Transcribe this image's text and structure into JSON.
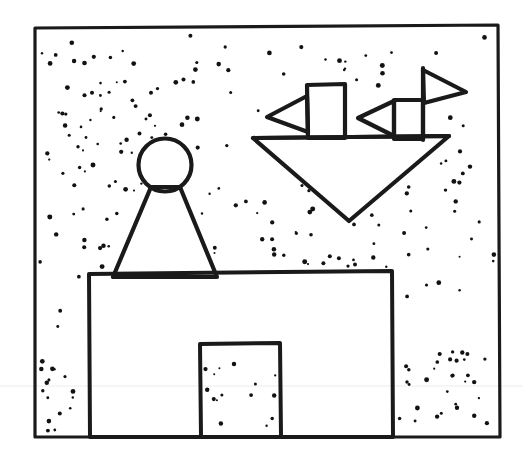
{
  "artwork": {
    "title": "Pawn Figure On Platform With Floating Flagged Boat",
    "medium": "hand-drawn ink line illustration",
    "background_color": "#ffffff",
    "ink_color": "#1a1a1a",
    "canvas": {
      "width": 523,
      "height": 466
    }
  },
  "frame": {
    "name": "picture-border",
    "stroke_width": 3.2,
    "points": "35,28 498,25 500,437 35,437"
  },
  "sky": {
    "name": "stippled-sky",
    "dot_color": "#121212",
    "dot_count": 232,
    "description": "scattered stipple dots filling background"
  },
  "figure": {
    "name": "pawn-figure",
    "head": {
      "cx": 165,
      "cy": 165,
      "r": 26.5,
      "stroke_width": 4.2
    },
    "body": {
      "points": "151,187 113,277 217,277 180,187",
      "stroke_width": 4.2
    }
  },
  "building": {
    "name": "platform-building",
    "stroke_width": 4.0,
    "outline": "89,274 392,271 393,437 90,437",
    "door": {
      "name": "doorway",
      "stroke_width": 4.0,
      "outline": "200,344 280,343 281,437 201,437"
    }
  },
  "boat": {
    "name": "floating-boat",
    "stroke_width": 4.2,
    "hull": {
      "points": "253,138 449,136 349,221"
    },
    "deck_line": "253,138 449,136",
    "masts": [
      {
        "name": "left-mast",
        "body": "307,85 345,84 345,138 308,138",
        "flag": {
          "name": "left-flag-pointing-left",
          "points": "307,96 267,117 308,132"
        }
      },
      {
        "name": "right-mast",
        "body": "394,100 423,100 423,139 394,139",
        "flag_left": {
          "name": "right-mast-flag-pointing-left",
          "points": "394,101 358,118 394,136"
        },
        "flag_right": {
          "name": "right-mast-flag-pointing-right",
          "points": "423,70 466,92 424,103"
        },
        "mast_pole": "423,68 423,140"
      }
    ]
  },
  "artifact": {
    "name": "faint-scan-line",
    "y": 386,
    "color": "#ececec"
  }
}
